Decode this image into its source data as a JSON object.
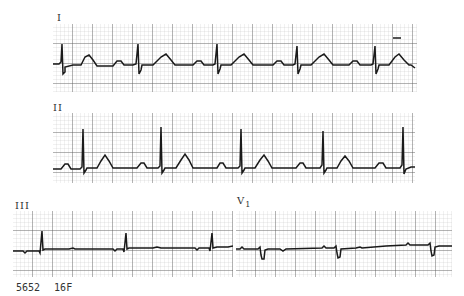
{
  "figure": {
    "type": "ecg_tracing",
    "leads": [
      {
        "id": "lead-I",
        "label": "I"
      },
      {
        "id": "lead-II",
        "label": "II"
      },
      {
        "id": "lead-III",
        "label": "III"
      },
      {
        "id": "lead-V1",
        "label": "V",
        "subscript": "1"
      }
    ],
    "footer": {
      "record_id": "5652",
      "patient": "16F"
    }
  },
  "colors": {
    "grid_major": "#555555",
    "grid_minor": "#bdbdbd",
    "trace": "#1a1a1a",
    "background": "#ffffff"
  }
}
